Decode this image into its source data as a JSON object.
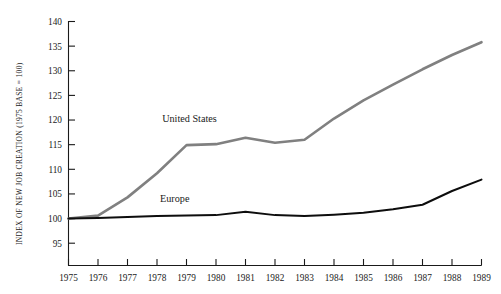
{
  "chart_data": {
    "type": "line",
    "title": "",
    "xlabel": "",
    "ylabel": "INDEX OF NEW JOB CREATION (1975 BASE = 100)",
    "x": [
      1975,
      1976,
      1977,
      1978,
      1979,
      1980,
      1981,
      1982,
      1983,
      1984,
      1985,
      1986,
      1987,
      1988,
      1989
    ],
    "xtick_labels": [
      "1975",
      "1976",
      "1977",
      "1978",
      "1979",
      "1980",
      "1981",
      "1982",
      "1983",
      "1984",
      "1985",
      "1986",
      "1987",
      "1988",
      "1989"
    ],
    "ytick_labels": [
      "95",
      "100",
      "105",
      "110",
      "115",
      "120",
      "125",
      "130",
      "135",
      "140"
    ],
    "yticks": [
      95,
      100,
      105,
      110,
      115,
      120,
      125,
      130,
      135,
      140
    ],
    "xlim": [
      1975,
      1989
    ],
    "ylim": [
      93,
      140
    ],
    "grid": false,
    "legend": "inline-labels",
    "series": [
      {
        "name": "United States",
        "color": "#808080",
        "label_x": 1979.1,
        "label_y": 119.6,
        "values": [
          100.0,
          100.6,
          104.3,
          109.2,
          114.9,
          115.1,
          116.4,
          115.4,
          116.0,
          120.3,
          124.0,
          127.2,
          130.3,
          133.2,
          135.8
        ]
      },
      {
        "name": "Europe",
        "color": "#0d0d0d",
        "label_x": 1978.6,
        "label_y": 103.4,
        "values": [
          100.0,
          100.1,
          100.3,
          100.5,
          100.6,
          100.7,
          101.4,
          100.7,
          100.5,
          100.8,
          101.2,
          101.9,
          102.8,
          105.6,
          107.9
        ]
      }
    ]
  }
}
